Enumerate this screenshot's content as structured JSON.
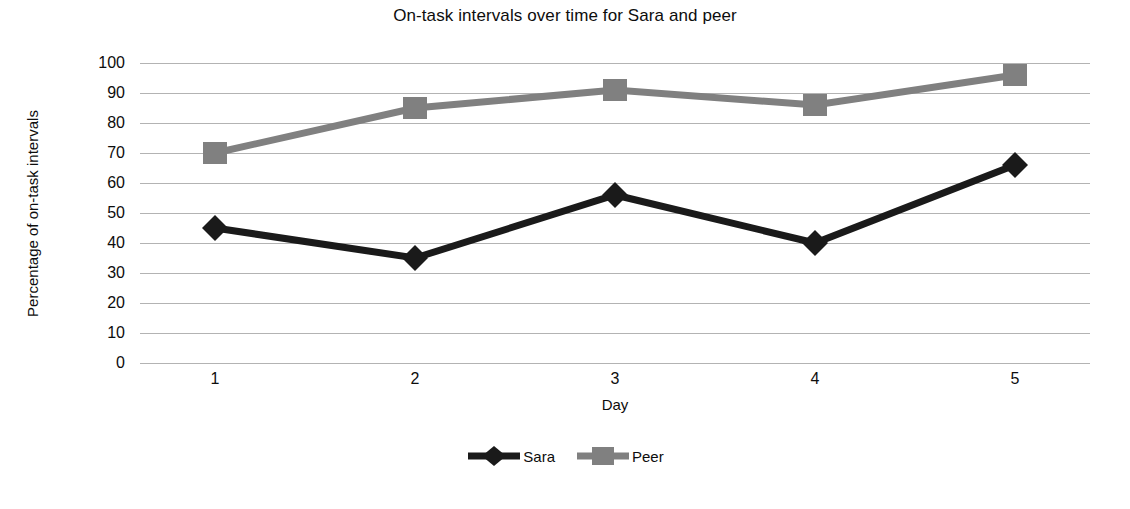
{
  "chart_data": {
    "type": "line",
    "title": "On-task intervals over time for Sara and peer",
    "xlabel": "Day",
    "ylabel": "Percentage of on-task intervals",
    "categories": [
      "1",
      "2",
      "3",
      "4",
      "5"
    ],
    "x": [
      1,
      2,
      3,
      4,
      5
    ],
    "series": [
      {
        "name": "Sara",
        "values": [
          45,
          35,
          56,
          40,
          66
        ],
        "color": "#1a1a1a",
        "marker": "diamond"
      },
      {
        "name": "Peer",
        "values": [
          70,
          85,
          91,
          86,
          96
        ],
        "color": "#808080",
        "marker": "square"
      }
    ],
    "ylim": [
      0,
      100
    ],
    "ytick_step": 10,
    "yticks": [
      "100",
      "90",
      "80",
      "70",
      "60",
      "50",
      "40",
      "30",
      "20",
      "10",
      "0"
    ],
    "grid": true,
    "grid_color": "#b3b3b3",
    "legend_position": "bottom"
  },
  "legend": {
    "entries": [
      {
        "label": "Sara"
      },
      {
        "label": "Peer"
      }
    ]
  }
}
